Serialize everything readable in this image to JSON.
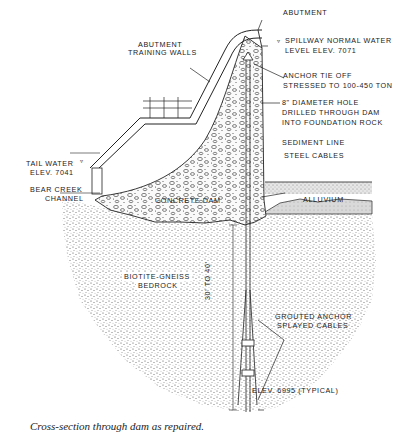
{
  "figure": {
    "caption": "Cross-section through dam as repaired.",
    "colors": {
      "ink": "#1a1a1a",
      "paper": "#ffffff",
      "stipple": "#555555"
    }
  },
  "labels": {
    "abutment": "ABUTMENT",
    "spillway_line1": "SPILLWAY NORMAL WATER",
    "spillway_line2": "LEVEL ELEV. 7071",
    "training_walls_line1": "ABUTMENT",
    "training_walls_line2": "TRAINING WALLS",
    "anchor_tie_line1": "ANCHOR TIE OFF",
    "anchor_tie_line2": "STRESSED TO 100-450 TON",
    "hole_line1": "8\" DIAMETER HOLE",
    "hole_line2": "DRILLED THROUGH DAM",
    "hole_line3": "INTO FOUNDATION ROCK",
    "sediment_line": "SEDIMENT LINE",
    "steel_cables": "STEEL CABLES",
    "alluvium": "ALLUVIUM",
    "tail_water_line1": "TAIL WATER",
    "tail_water_line2": "ELEV. 7041",
    "bear_creek_line1": "BEAR CREEK",
    "bear_creek_line2": "CHANNEL",
    "concrete_dam": "CONCRETE DAM",
    "bedrock_line1": "BIOTITE-GNEISS",
    "bedrock_line2": "BEDROCK",
    "depth_range": "30' TO 40'",
    "grouted_line1": "GROUTED ANCHOR",
    "grouted_line2": "SPLAYED CABLES",
    "elev_bottom": "ELEV. 6995 (TYPICAL)"
  }
}
